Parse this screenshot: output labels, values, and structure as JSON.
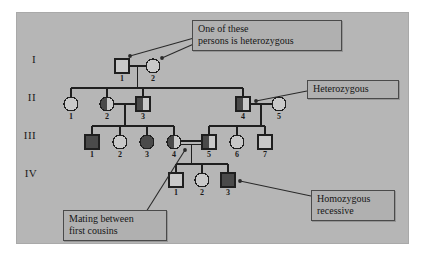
{
  "figure": {
    "type": "pedigree-chart",
    "background_color": "#b6b6b6",
    "page_color": "#ffffff",
    "line_color": "#1f1f1f",
    "affected_fill": "#4a4a4a",
    "unaffected_fill": "#c9c9c9"
  },
  "generation_labels": [
    {
      "id": "gen-1",
      "text": "I",
      "x": 34,
      "y": 60
    },
    {
      "id": "gen-2",
      "text": "II",
      "x": 32,
      "y": 98
    },
    {
      "id": "gen-3",
      "text": "III",
      "x": 30,
      "y": 136
    },
    {
      "id": "gen-4",
      "text": "IV",
      "x": 31,
      "y": 174
    }
  ],
  "individuals": [
    {
      "name": "I-1",
      "gen": "I",
      "num": "1",
      "sex": "male",
      "fill": "none",
      "cx": 122,
      "cy": 66
    },
    {
      "name": "I-2",
      "gen": "I",
      "num": "2",
      "sex": "female",
      "fill": "none",
      "cx": 153,
      "cy": 66
    },
    {
      "name": "II-1",
      "gen": "II",
      "num": "1",
      "sex": "female",
      "fill": "none",
      "cx": 71,
      "cy": 104
    },
    {
      "name": "II-2",
      "gen": "II",
      "num": "2",
      "sex": "female",
      "fill": "half-left",
      "cx": 107,
      "cy": 104
    },
    {
      "name": "II-3",
      "gen": "II",
      "num": "3",
      "sex": "male",
      "fill": "half-left",
      "cx": 143,
      "cy": 104
    },
    {
      "name": "II-4",
      "gen": "II",
      "num": "4",
      "sex": "male",
      "fill": "half-left",
      "cx": 243,
      "cy": 104
    },
    {
      "name": "II-5",
      "gen": "II",
      "num": "5",
      "sex": "female",
      "fill": "none",
      "cx": 279,
      "cy": 104
    },
    {
      "name": "III-1",
      "gen": "III",
      "num": "1",
      "sex": "male",
      "fill": "full",
      "cx": 92,
      "cy": 142
    },
    {
      "name": "III-2",
      "gen": "III",
      "num": "2",
      "sex": "female",
      "fill": "none",
      "cx": 120,
      "cy": 142
    },
    {
      "name": "III-3",
      "gen": "III",
      "num": "3",
      "sex": "female",
      "fill": "full",
      "cx": 147,
      "cy": 142
    },
    {
      "name": "III-4",
      "gen": "III",
      "num": "4",
      "sex": "female",
      "fill": "half-left",
      "cx": 174,
      "cy": 142
    },
    {
      "name": "III-5",
      "gen": "III",
      "num": "5",
      "sex": "male",
      "fill": "half-left",
      "cx": 209,
      "cy": 142
    },
    {
      "name": "III-6",
      "gen": "III",
      "num": "6",
      "sex": "female",
      "fill": "none",
      "cx": 237,
      "cy": 142
    },
    {
      "name": "III-7",
      "gen": "III",
      "num": "7",
      "sex": "male",
      "fill": "none",
      "cx": 265,
      "cy": 142
    },
    {
      "name": "IV-1",
      "gen": "IV",
      "num": "1",
      "sex": "male",
      "fill": "none",
      "cx": 176,
      "cy": 180
    },
    {
      "name": "IV-2",
      "gen": "IV",
      "num": "2",
      "sex": "female",
      "fill": "none",
      "cx": 202,
      "cy": 180
    },
    {
      "name": "IV-3",
      "gen": "IV",
      "num": "3",
      "sex": "male",
      "fill": "full",
      "cx": 228,
      "cy": 180
    }
  ],
  "callouts": [
    {
      "name": "callout-heterozygous-pair",
      "text": "One of these\npersons is heterozygous",
      "x": 192,
      "y": 20,
      "w": 138,
      "leaders": [
        {
          "from_x": 194,
          "from_y": 38,
          "to_x": 130,
          "to_y": 56
        },
        {
          "from_x": 196,
          "from_y": 43,
          "to_x": 162,
          "to_y": 58
        }
      ]
    },
    {
      "name": "callout-heterozygous",
      "text": "Heterozygous",
      "x": 307,
      "y": 80,
      "w": 80,
      "leaders": [
        {
          "from_x": 307,
          "from_y": 91,
          "to_x": 256,
          "to_y": 101
        }
      ]
    },
    {
      "name": "callout-homozygous-recessive",
      "text": "Homozygous\nrecessive",
      "x": 311,
      "y": 190,
      "w": 72,
      "leaders": [
        {
          "from_x": 311,
          "from_y": 196,
          "to_x": 240,
          "to_y": 181
        }
      ]
    },
    {
      "name": "callout-first-cousins",
      "text": "Mating between\nfirst cousins",
      "x": 63,
      "y": 210,
      "w": 92,
      "leaders": [
        {
          "from_x": 146,
          "from_y": 212,
          "to_x": 185,
          "to_y": 150
        }
      ]
    }
  ],
  "relationships": [
    {
      "name": "mating-I1-I2",
      "type": "mating"
    },
    {
      "name": "sibship-II",
      "type": "sibship",
      "children": [
        "II-1",
        "II-2",
        "II-3",
        "II-4"
      ]
    },
    {
      "name": "mating-II2-II3",
      "type": "mating"
    },
    {
      "name": "mating-II4-II5",
      "type": "mating"
    },
    {
      "name": "sibship-III-left",
      "type": "sibship",
      "children": [
        "III-1",
        "III-2",
        "III-3",
        "III-4"
      ]
    },
    {
      "name": "sibship-III-right",
      "type": "sibship",
      "children": [
        "III-5",
        "III-6",
        "III-7"
      ]
    },
    {
      "name": "mating-III4-III5",
      "type": "consanguineous-mating",
      "double_line": true
    },
    {
      "name": "sibship-IV",
      "type": "sibship",
      "children": [
        "IV-1",
        "IV-2",
        "IV-3"
      ]
    }
  ]
}
